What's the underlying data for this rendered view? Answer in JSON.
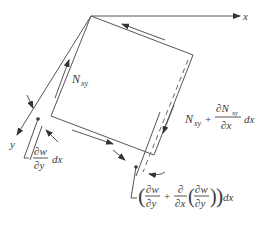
{
  "diagram": {
    "type": "shear-deformed plate element",
    "axes": {
      "x_label": "x",
      "y_label": "y"
    },
    "labels": {
      "nxy": {
        "base": "N",
        "sub": "xy"
      },
      "nxy_plus": {
        "base": "N",
        "sub": "xy",
        "plus": "+",
        "num_partial": "∂N",
        "num_sub": "xy",
        "den": "∂x",
        "tail": "dx"
      },
      "slope_left": {
        "num": "∂w",
        "den": "∂y",
        "tail": "dx"
      },
      "slope_right": {
        "open": "(",
        "num1": "∂w",
        "den1": "∂y",
        "plus": "+",
        "num2": "∂",
        "den2": "∂x",
        "num3": "∂w",
        "den3": "∂y",
        "close": ")",
        "tail": "dx"
      }
    },
    "colors": {
      "line": "#555555",
      "text": "#3a3a3a",
      "background": "#ffffff"
    }
  }
}
